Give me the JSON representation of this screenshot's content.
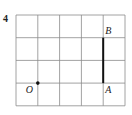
{
  "problem_number": "4",
  "grid": {
    "columns": 5,
    "rows": 4,
    "line_color": "#8a8a8a"
  },
  "points": [
    {
      "name": "O",
      "grid_x": 1,
      "grid_y": 1,
      "marker": "dot"
    },
    {
      "name": "A",
      "grid_x": 4,
      "grid_y": 1,
      "marker": "none"
    },
    {
      "name": "B",
      "grid_x": 4,
      "grid_y": 3,
      "marker": "none"
    }
  ],
  "segments": [
    {
      "from": "A",
      "to": "B",
      "color": "#111111"
    }
  ]
}
